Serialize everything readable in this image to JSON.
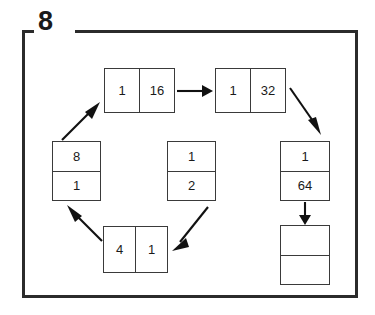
{
  "frame": {
    "legend_label": "8"
  },
  "nodes": [
    {
      "id": "node-1-16",
      "orientation": "horizontal",
      "cells": [
        "1",
        "16"
      ]
    },
    {
      "id": "node-1-32",
      "orientation": "horizontal",
      "cells": [
        "1",
        "32"
      ]
    },
    {
      "id": "node-8-1",
      "orientation": "vertical",
      "cells": [
        "8",
        "1"
      ]
    },
    {
      "id": "node-1-2",
      "orientation": "vertical",
      "cells": [
        "1",
        "2"
      ]
    },
    {
      "id": "node-1-64",
      "orientation": "vertical",
      "cells": [
        "1",
        "64"
      ]
    },
    {
      "id": "node-4-1",
      "orientation": "horizontal",
      "cells": [
        "4",
        "1"
      ]
    },
    {
      "id": "node-empty",
      "orientation": "vertical",
      "cells": [
        "",
        ""
      ]
    }
  ],
  "arrows": [
    {
      "id": "arrow-1-16-to-1-32",
      "direction": "right",
      "from": "node-1-16",
      "to": "node-1-32"
    },
    {
      "id": "arrow-1-32-to-1-64",
      "direction": "down-right",
      "from": "node-1-32",
      "to": "node-1-64"
    },
    {
      "id": "arrow-1-64-to-empty",
      "direction": "down",
      "from": "node-1-64",
      "to": "node-empty"
    },
    {
      "id": "arrow-1-2-to-4-1",
      "direction": "down-left",
      "from": "node-1-2",
      "to": "node-4-1"
    },
    {
      "id": "arrow-4-1-to-8-1",
      "direction": "up-left",
      "from": "node-4-1",
      "to": "node-8-1"
    },
    {
      "id": "arrow-8-1-to-1-16",
      "direction": "up-right",
      "from": "node-8-1",
      "to": "node-1-16"
    }
  ],
  "colors": {
    "frame": "#2b2b2b",
    "box_border": "#3a3a3a",
    "arrow": "#111111",
    "text": "#1a1a1a",
    "background": "#ffffff"
  }
}
